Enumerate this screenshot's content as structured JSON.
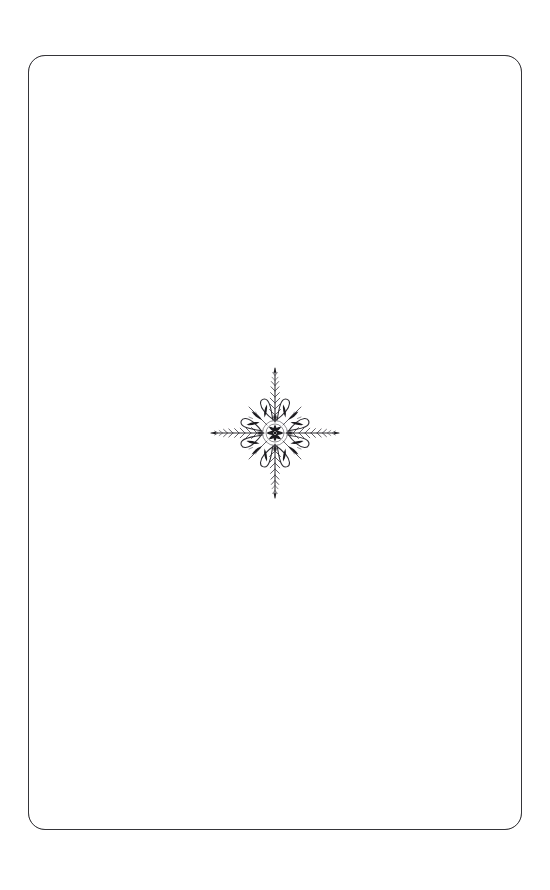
{
  "document": {
    "kind": "scanned-book-page",
    "page_background_color": "#ffffff",
    "ink_color": "#1b1a1e",
    "body_text": "",
    "header_text": "",
    "footer_text": "",
    "page_number": "",
    "caption": ""
  },
  "frame": {
    "name": "page-border-rule",
    "shape": "rounded-rectangle",
    "stroke_color": "#232225",
    "stroke_width_px": 1.1,
    "corner_radius_px": 17,
    "left_px": 28,
    "top_px": 55,
    "width_px": 494,
    "height_px": 775
  },
  "ornament": {
    "name": "central-fleuron",
    "label": "",
    "style": "foliate four-point star fleuron",
    "symmetry": "four-fold",
    "center_x_px": 275,
    "center_y_px": 443,
    "bounding_box_px": {
      "left": 215,
      "top": 380,
      "width": 120,
      "height": 126
    },
    "ink_dark": "#1b1a1e",
    "ink_outline": "#2b2a2f",
    "elements": {
      "barbed_spikes": 4,
      "loop_petals": 8,
      "dark_leaf_sprigs": 8,
      "center_rosette_leaves": 8
    }
  }
}
